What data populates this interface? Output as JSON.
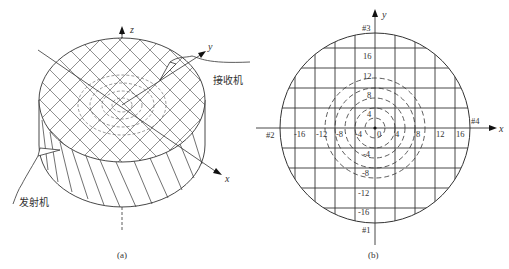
{
  "panel_a": {
    "caption": "(a)",
    "axis_labels": {
      "x": "x",
      "y": "y",
      "z": "z"
    },
    "receiver_label": "接收机",
    "transmitter_label": "发射机"
  },
  "panel_b": {
    "caption": "(b)",
    "axis_labels": {
      "x": "x",
      "y": "y"
    },
    "sensor_labels": {
      "s1": "#1",
      "s2": "#2",
      "s3": "#3",
      "s4": "#4"
    },
    "x_ticks": [
      "-16",
      "-12",
      "-8",
      "-4",
      "0",
      "4",
      "8",
      "12",
      "16"
    ],
    "y_ticks": [
      "16",
      "12",
      "8",
      "4",
      "-4",
      "-8",
      "-12",
      "-16"
    ],
    "dashed_circle_radii": [
      2,
      4,
      6,
      8,
      10
    ],
    "grid_spacing": 4
  }
}
